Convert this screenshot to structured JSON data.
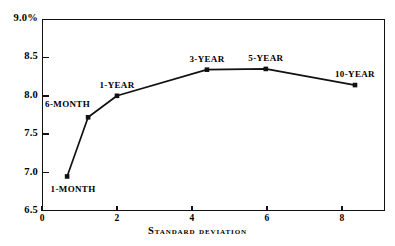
{
  "chart_data": {
    "type": "line",
    "title": "",
    "xlabel": "Standard deviation",
    "ylabel": "",
    "xlim": [
      0,
      9.15
    ],
    "ylim": [
      6.5,
      9.0
    ],
    "grid": false,
    "legend": null,
    "x_ticks": [
      {
        "value": 0,
        "label": "0"
      },
      {
        "value": 2,
        "label": "2"
      },
      {
        "value": 4,
        "label": "4"
      },
      {
        "value": 6,
        "label": "6"
      },
      {
        "value": 8,
        "label": "8"
      }
    ],
    "y_ticks": [
      {
        "value": 9.0,
        "label": "9.0%"
      },
      {
        "value": 8.5,
        "label": "8.5"
      },
      {
        "value": 8.0,
        "label": "8.0"
      },
      {
        "value": 7.5,
        "label": "7.5"
      },
      {
        "value": 7.0,
        "label": "7.0"
      },
      {
        "value": 6.5,
        "label": "6.5"
      }
    ],
    "series": [
      {
        "name": "yield-vs-standard-deviation",
        "marker": "square",
        "color": "#111111",
        "points": [
          {
            "label": "1-MONTH",
            "x": 0.67,
            "y": 6.95,
            "label_pos": "below"
          },
          {
            "label": "6-MONTH",
            "x": 1.23,
            "y": 7.72,
            "label_pos": "above-left"
          },
          {
            "label": "1-YEAR",
            "x": 2.0,
            "y": 8.0,
            "label_pos": "above"
          },
          {
            "label": "3-YEAR",
            "x": 4.4,
            "y": 8.34,
            "label_pos": "above"
          },
          {
            "label": "5-YEAR",
            "x": 5.97,
            "y": 8.35,
            "label_pos": "above"
          },
          {
            "label": "10-YEAR",
            "x": 8.35,
            "y": 8.14,
            "label_pos": "above"
          }
        ]
      }
    ]
  }
}
